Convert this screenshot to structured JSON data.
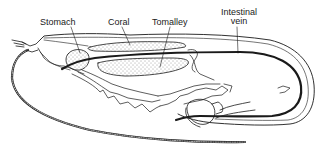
{
  "diagram": {
    "colors": {
      "stroke": "#1a1a1a",
      "background": "#ffffff",
      "stipple": "#333333"
    },
    "labels": [
      {
        "id": "stomach",
        "text": "Stomach"
      },
      {
        "id": "coral",
        "text": "Coral"
      },
      {
        "id": "tomalley",
        "text": "Tomalley"
      },
      {
        "id": "intestinal_vein_line1",
        "text": "Intestinal"
      },
      {
        "id": "intestinal_vein_line2",
        "text": "vein"
      }
    ]
  }
}
